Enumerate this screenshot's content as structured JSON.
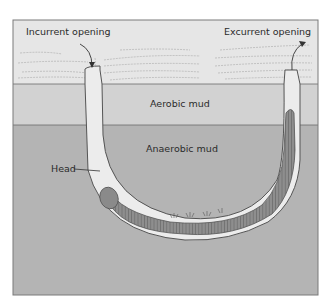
{
  "diagram": {
    "labels": {
      "incurrent": "Incurrent opening",
      "excurrent": "Excurrent opening",
      "aerobic": "Aerobic mud",
      "anaerobic": "Anaerobic mud",
      "head": "Head"
    },
    "colors": {
      "water": "#e6e6e6",
      "aerobic_mud": "#d2d2d2",
      "anaerobic_mud": "#b4b4b4",
      "burrow": "#ececec",
      "worm": "#8c8c8c",
      "outline": "#555555",
      "border": "#7a7a7a"
    }
  }
}
